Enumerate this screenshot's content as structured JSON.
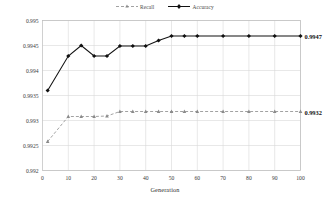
{
  "chart_data": {
    "type": "line",
    "title": "",
    "xlabel": "Generation",
    "ylabel": "",
    "xlim": [
      0,
      100
    ],
    "ylim": [
      0.992,
      0.995
    ],
    "grid": true,
    "legend_position": "top-center",
    "xticks": [
      0,
      10,
      20,
      30,
      40,
      50,
      60,
      70,
      80,
      90,
      100
    ],
    "xtick_labels": [
      "0",
      "10",
      "20",
      "30",
      "40",
      "50",
      "60",
      "70",
      "80",
      "90",
      "100"
    ],
    "yticks": [
      0.992,
      0.9925,
      0.993,
      0.9935,
      0.994,
      0.9945,
      0.995
    ],
    "ytick_labels": [
      "0.992",
      "0.9925",
      "0.993",
      "0.9935",
      "0.994",
      "0.9945",
      "0.995"
    ],
    "x": [
      2,
      10,
      15,
      20,
      25,
      30,
      35,
      40,
      45,
      50,
      55,
      60,
      70,
      80,
      90,
      100
    ],
    "series": [
      {
        "name": "Recall",
        "color": "#8a8a8a",
        "style": "dashed",
        "marker": "triangle",
        "end_label": "0.9932",
        "values": [
          0.99258,
          0.99308,
          0.99308,
          0.99308,
          0.99309,
          0.99318,
          0.99318,
          0.99318,
          0.99318,
          0.99318,
          0.99318,
          0.99318,
          0.99318,
          0.99318,
          0.99318,
          0.99318
        ]
      },
      {
        "name": "Accuracy",
        "color": "#111111",
        "style": "solid",
        "marker": "diamond",
        "end_label": "0.9947",
        "values": [
          0.9936,
          0.99429,
          0.9945,
          0.99429,
          0.99429,
          0.99449,
          0.99449,
          0.99449,
          0.9946,
          0.99469,
          0.99469,
          0.99469,
          0.99469,
          0.99469,
          0.99469,
          0.99469
        ]
      }
    ]
  }
}
